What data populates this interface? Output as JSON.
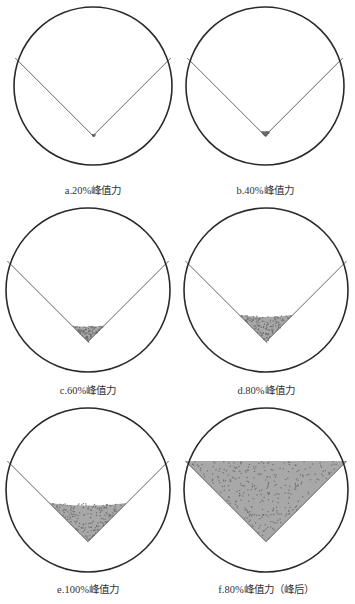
{
  "figure": {
    "panels": [
      {
        "id": "a",
        "caption": "a.20%峰值力",
        "load_percent": 20,
        "phase": "pre-peak",
        "fill_level": 0.02
      },
      {
        "id": "b",
        "caption": "b.40%峰值力",
        "load_percent": 40,
        "phase": "pre-peak",
        "fill_level": 0.06
      },
      {
        "id": "c",
        "caption": "c.60%峰值力",
        "load_percent": 60,
        "phase": "pre-peak",
        "fill_level": 0.2
      },
      {
        "id": "d",
        "caption": "d.80%峰值力",
        "load_percent": 80,
        "phase": "pre-peak",
        "fill_level": 0.33
      },
      {
        "id": "e",
        "caption": "e.100%峰值力",
        "load_percent": 100,
        "phase": "peak",
        "fill_level": 0.48
      },
      {
        "id": "f",
        "caption": "f.80%峰值力（峰后）",
        "load_percent": 80,
        "phase": "post-peak",
        "fill_level": 1.0
      }
    ],
    "colors": {
      "circle": "#2a2a2a",
      "v_line": "#555555",
      "damage_fill": "#a8a8a8",
      "damage_dark": "#6e6e6e"
    }
  }
}
